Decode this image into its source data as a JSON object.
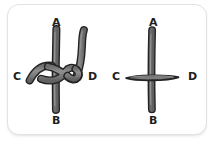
{
  "canvas": {
    "width": 215,
    "height": 143,
    "background_color": "#ffffff"
  },
  "card": {
    "background_color": "#ffffff",
    "border_color": "#e2e2e2",
    "corner_radius_px": 12,
    "has_drop_shadow": true
  },
  "style": {
    "rope_fill_color": "#7d7d7d",
    "rope_outline_color": "#232323",
    "rope_highlight_color": "#9a9a9a",
    "label_color": "#1e1e1e",
    "rope_thickness_px": 6
  },
  "figures": [
    {
      "id": "left-figure",
      "name": "knotted-rope-crossing",
      "description": "Vertical strand A-B with a second strand running from C that wraps around it and exits upward at D, forming a knot / hitch at the crossing point.",
      "strands": [
        {
          "id": "vertical-strand",
          "from_label": "A",
          "to_label": "B",
          "orientation": "vertical",
          "over_under": "passes-behind-knot"
        },
        {
          "id": "wrapping-strand",
          "from_label": "C",
          "to_label": "D",
          "orientation": "curved",
          "over_under": "wraps-over-vertical-strand"
        }
      ],
      "labels": [
        {
          "text": "A",
          "position": "top"
        },
        {
          "text": "B",
          "position": "bottom"
        },
        {
          "text": "C",
          "position": "left"
        },
        {
          "text": "D",
          "position": "right"
        }
      ]
    },
    {
      "id": "right-figure",
      "name": "simple-rope-crossing",
      "description": "Vertical strand A-B crossed by a straight horizontal strand C-D with no knot; horizontal strand lies in front.",
      "strands": [
        {
          "id": "vertical-strand",
          "from_label": "A",
          "to_label": "B",
          "orientation": "vertical",
          "over_under": "behind"
        },
        {
          "id": "horizontal-strand",
          "from_label": "C",
          "to_label": "D",
          "orientation": "horizontal",
          "over_under": "in-front"
        }
      ],
      "labels": [
        {
          "text": "A",
          "position": "top"
        },
        {
          "text": "B",
          "position": "bottom"
        },
        {
          "text": "C",
          "position": "left"
        },
        {
          "text": "D",
          "position": "right"
        }
      ]
    }
  ]
}
